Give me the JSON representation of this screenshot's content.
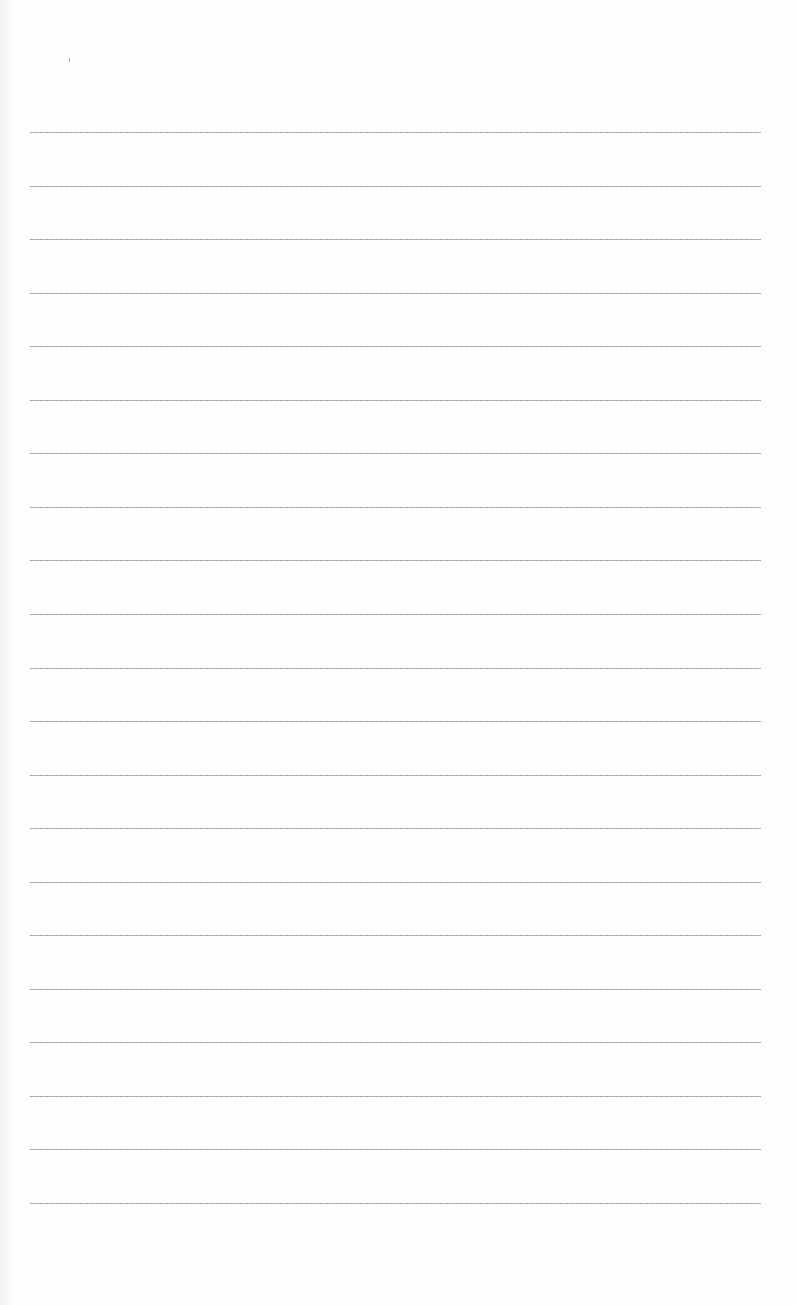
{
  "page": {
    "type": "blank lined paper",
    "background_color": "#fefefe",
    "line_color": "#a0a0a0",
    "line_count": 21,
    "first_line_y": 132,
    "line_spacing": 53.55,
    "line_left": 30,
    "line_right": 761
  }
}
